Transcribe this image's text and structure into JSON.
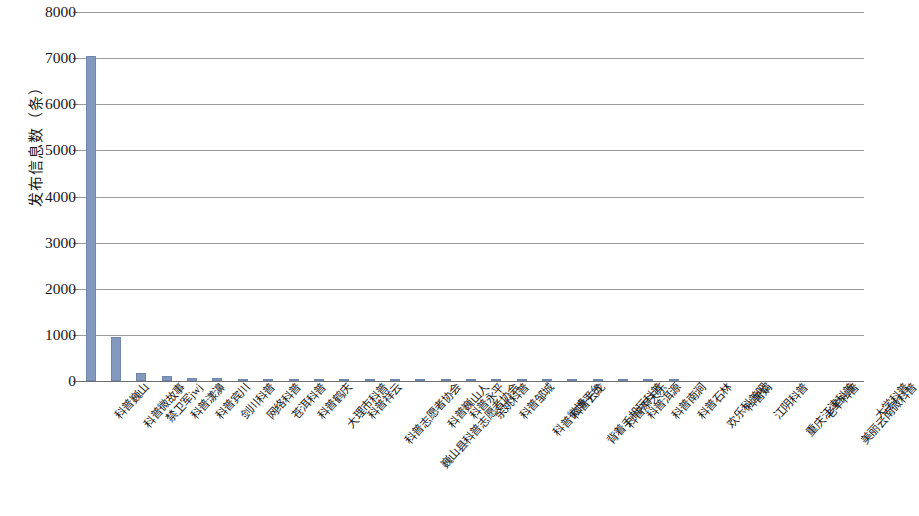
{
  "chart_data": {
    "type": "bar",
    "title": "",
    "subtitle": "",
    "xlabel": "",
    "ylabel": "发布信息数（条）",
    "ylim": [
      0,
      8000
    ],
    "ytick_labels": [
      "8000",
      "7000",
      "6000",
      "5000",
      "4000",
      "3000",
      "2000",
      "1000",
      "0"
    ],
    "ytick_values": [
      8000,
      7000,
      6000,
      5000,
      4000,
      3000,
      2000,
      1000,
      0
    ],
    "grid": true,
    "legend": false,
    "legend_position": "none",
    "bar_color": "#8299bd",
    "bar_edge_color": "#6f87ae",
    "gridline_color": "#9a9a9a",
    "categories": [
      "科普巍山",
      "科普微故事",
      "禁卫军jwj",
      "科普漾濞",
      "科普宾川",
      "剑川科普",
      "网络科普",
      "苍洱科普",
      "科普鹤庆",
      "大理市科普",
      "科普祥云",
      "科普志愿者协会",
      "巍山县科普志愿者协会",
      "科普巍山人",
      "科普永平",
      "余姚科普",
      "科普邹城",
      "科普微博平台",
      "科普云龙",
      "背着手机玩科普",
      "科普添天乐",
      "科普洱源",
      "科普南涧",
      "科普石林",
      "欢乐科普吧",
      "科普娟",
      "江阴科普",
      "重庆江津科普",
      "老羊科普",
      "美丽云南微科普",
      "大学科普"
    ],
    "values": [
      7050,
      950,
      170,
      100,
      60,
      55,
      50,
      20,
      15,
      10,
      8,
      6,
      5,
      4,
      3,
      3,
      2,
      2,
      2,
      1,
      1,
      1,
      1,
      1,
      0,
      0,
      0,
      0,
      0,
      0,
      0
    ]
  }
}
